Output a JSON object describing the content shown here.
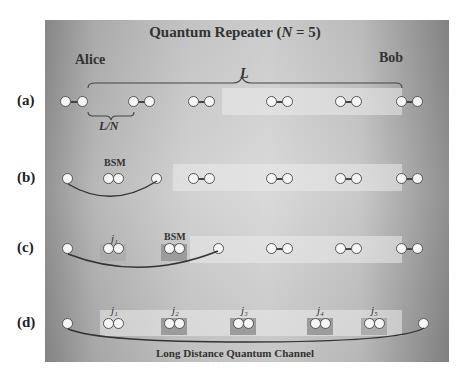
{
  "title": {
    "prefix": "Quantum Repeater (",
    "var": "N",
    "suffix": " = 5)"
  },
  "endpoints": {
    "left": "Alice",
    "right": "Bob"
  },
  "length_label": "L",
  "segment_label": "L/N",
  "row_labels": [
    "(a)",
    "(b)",
    "(c)",
    "(d)"
  ],
  "bsm_label": "BSM",
  "swap_labels": {
    "j1": "j₁",
    "j2": "j₂",
    "j3": "j₃",
    "j4": "j₄",
    "j5": "j₅"
  },
  "channel_label": "Long Distance Quantum Channel"
}
